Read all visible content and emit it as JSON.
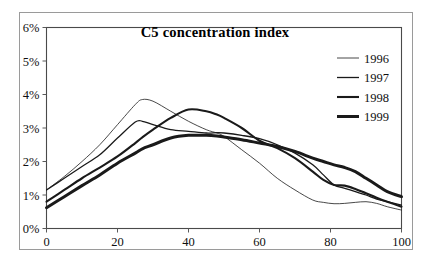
{
  "chart_data": {
    "type": "line",
    "title": "C5 concentration index",
    "xlabel": "",
    "ylabel": "",
    "xlim": [
      0,
      100
    ],
    "ylim": [
      0,
      6
    ],
    "grid": false,
    "legend_position": "top-right",
    "x_ticks": [
      "0",
      "20",
      "40",
      "60",
      "80",
      "100"
    ],
    "x_tick_values": [
      0,
      20,
      40,
      60,
      80,
      100
    ],
    "y_ticks": [
      "0%",
      "1%",
      "2%",
      "3%",
      "4%",
      "5%",
      "6%"
    ],
    "y_tick_values": [
      0,
      1,
      2,
      3,
      4,
      5,
      6
    ],
    "x": [
      0,
      5,
      10,
      15,
      20,
      25,
      27,
      30,
      35,
      40,
      45,
      48,
      50,
      55,
      60,
      65,
      70,
      75,
      78,
      81,
      84,
      87,
      90,
      93,
      96,
      100
    ],
    "series": [
      {
        "name": "1996",
        "stroke_width": 0.8,
        "values": [
          1.15,
          1.55,
          2.0,
          2.5,
          3.1,
          3.7,
          3.85,
          3.8,
          3.5,
          3.2,
          2.95,
          2.85,
          2.75,
          2.35,
          1.95,
          1.5,
          1.15,
          0.85,
          0.78,
          0.74,
          0.75,
          0.78,
          0.8,
          0.75,
          0.65,
          0.55
        ]
      },
      {
        "name": "1997",
        "stroke_width": 1.3,
        "values": [
          1.15,
          1.5,
          1.85,
          2.2,
          2.7,
          3.18,
          3.2,
          3.1,
          2.95,
          2.9,
          2.85,
          2.86,
          2.85,
          2.78,
          2.68,
          2.5,
          2.25,
          1.9,
          1.6,
          1.3,
          1.2,
          1.1,
          1.0,
          0.88,
          0.8,
          0.7
        ]
      },
      {
        "name": "1998",
        "stroke_width": 2.1,
        "values": [
          0.8,
          1.15,
          1.5,
          1.82,
          2.15,
          2.55,
          2.72,
          2.95,
          3.3,
          3.55,
          3.5,
          3.4,
          3.3,
          3.0,
          2.62,
          2.4,
          2.1,
          1.7,
          1.45,
          1.3,
          1.28,
          1.18,
          1.05,
          0.92,
          0.8,
          0.65
        ]
      },
      {
        "name": "1999",
        "stroke_width": 3.0,
        "values": [
          0.62,
          0.95,
          1.28,
          1.6,
          1.95,
          2.25,
          2.38,
          2.5,
          2.7,
          2.78,
          2.78,
          2.76,
          2.73,
          2.65,
          2.55,
          2.45,
          2.3,
          2.1,
          2.0,
          1.9,
          1.82,
          1.7,
          1.5,
          1.3,
          1.1,
          0.95
        ]
      }
    ]
  },
  "legend": {
    "entries": [
      {
        "label": "1996"
      },
      {
        "label": "1997"
      },
      {
        "label": "1998"
      },
      {
        "label": "1999"
      }
    ]
  },
  "colors": {
    "series_stroke": "#1a1a1a",
    "axis": "#3a3a3a",
    "frame": "#4a4a4a",
    "outer_frame": "#9a9a9a",
    "background": "#ffffff"
  }
}
